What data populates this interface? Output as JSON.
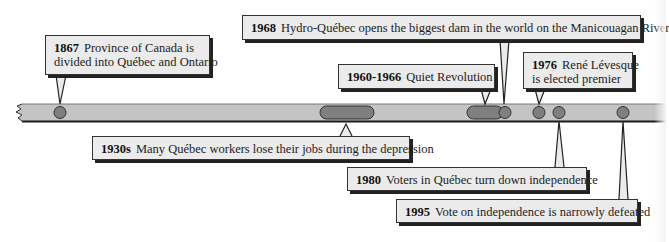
{
  "colors": {
    "bar_fill": "#c4c4c4",
    "bar_edge": "#1a1a1a",
    "marker_fill": "#7f7f7f",
    "callout_fill": "#ebebeb",
    "callout_border": "#333333"
  },
  "timeline": {
    "events": [
      {
        "id": "e1867",
        "year": "1867",
        "text": "Province of Canada is",
        "text2": "divided into Québec and Ontario",
        "type": "point"
      },
      {
        "id": "e1930s",
        "year": "1930s",
        "text": "Many Québec workers lose their jobs during the depression",
        "type": "period"
      },
      {
        "id": "e1960",
        "year": "1960-1966",
        "text": "Quiet Revolution",
        "type": "period"
      },
      {
        "id": "e1968",
        "year": "1968",
        "text": "Hydro-Québec opens the biggest dam in the world on the Manicouagan River",
        "type": "point"
      },
      {
        "id": "e1976",
        "year": "1976",
        "text": "René Lévesque",
        "text2": "is elected premier",
        "type": "point"
      },
      {
        "id": "e1980",
        "year": "1980",
        "text": "Voters in Québec turn down independence",
        "type": "point"
      },
      {
        "id": "e1995",
        "year": "1995",
        "text": "Vote on independence is narrowly defeated",
        "type": "point"
      }
    ]
  }
}
